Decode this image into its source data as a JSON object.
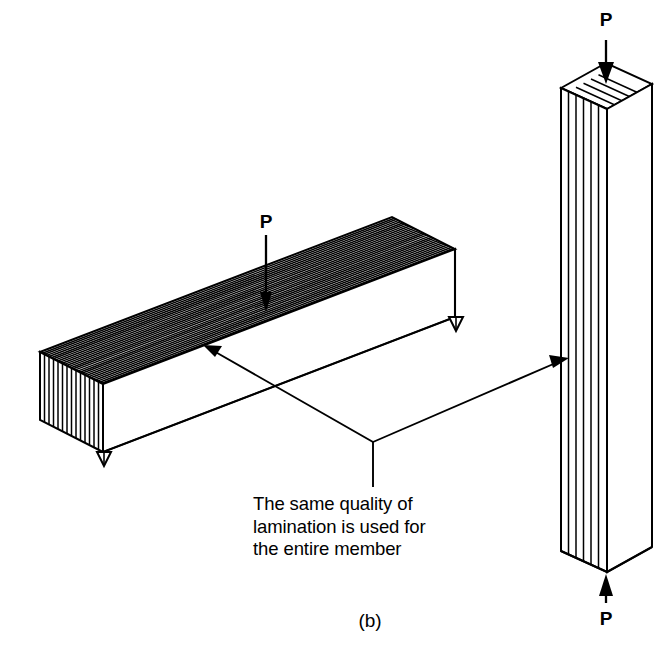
{
  "figure": {
    "part_label": "(b)",
    "caption": "The same quality of\nlamination is used for\nthe entire member",
    "background_color": "#ffffff",
    "line_color": "#000000"
  },
  "beam": {
    "name": "glued-laminated-beam",
    "load_label": "P",
    "load_direction": "downward",
    "orientation": "horizontal",
    "lamination_orientation": "horizontal-layers",
    "top_face_lamination_count": 26,
    "end_face_lamination_count": 14,
    "supports": 2,
    "support_type": "triangular-bearing"
  },
  "column": {
    "name": "glued-laminated-column",
    "top_load_label": "P",
    "bottom_load_label": "P",
    "top_load_direction": "downward",
    "bottom_load_direction": "upward",
    "orientation": "vertical",
    "lamination_orientation": "vertical-layers",
    "front_face_lamination_count": 5,
    "top_face_lamination_count": 6
  },
  "annotations": {
    "leader_to_beam": "arrow-to-beam-top-surface",
    "leader_to_column": "arrow-to-column-front-face"
  }
}
